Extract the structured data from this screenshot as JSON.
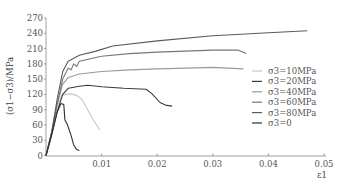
{
  "chart_data": {
    "type": "line",
    "title": "",
    "xlabel": "ε1",
    "ylabel": "(σ1−σ3)/MPa",
    "xlim": [
      0,
      0.05
    ],
    "ylim": [
      0,
      270
    ],
    "x_ticks": [
      "0.01",
      "0.02",
      "0.03",
      "0.04",
      "0.05"
    ],
    "y_ticks": [
      "0",
      "30",
      "60",
      "90",
      "120",
      "150",
      "180",
      "210",
      "240",
      "270"
    ],
    "grid": false,
    "legend_position": "right-middle",
    "series": [
      {
        "name": "σ3=10MPa",
        "color": "#c8c8c8",
        "points": [
          [
            0,
            0
          ],
          [
            0.001,
            45
          ],
          [
            0.002,
            95
          ],
          [
            0.0028,
            118
          ],
          [
            0.0035,
            120
          ],
          [
            0.0045,
            121
          ],
          [
            0.0055,
            118
          ],
          [
            0.0065,
            110
          ],
          [
            0.0075,
            90
          ],
          [
            0.0085,
            70
          ],
          [
            0.0097,
            50
          ]
        ]
      },
      {
        "name": "σ3=20MPa",
        "color": "#3a3a3a",
        "points": [
          [
            0,
            0
          ],
          [
            0.001,
            40
          ],
          [
            0.002,
            85
          ],
          [
            0.003,
            120
          ],
          [
            0.004,
            132
          ],
          [
            0.006,
            136
          ],
          [
            0.0075,
            138
          ],
          [
            0.01,
            135
          ],
          [
            0.014,
            132
          ],
          [
            0.018,
            130
          ],
          [
            0.019,
            122
          ],
          [
            0.0205,
            104
          ],
          [
            0.0215,
            99
          ],
          [
            0.0227,
            97
          ]
        ]
      },
      {
        "name": "σ3=40MPa",
        "color": "#9a9a9a",
        "points": [
          [
            0,
            0
          ],
          [
            0.001,
            45
          ],
          [
            0.002,
            100
          ],
          [
            0.003,
            140
          ],
          [
            0.004,
            153
          ],
          [
            0.006,
            160
          ],
          [
            0.01,
            165
          ],
          [
            0.015,
            168
          ],
          [
            0.02,
            170
          ],
          [
            0.027,
            172
          ],
          [
            0.03,
            173
          ],
          [
            0.0355,
            170
          ]
        ]
      },
      {
        "name": "σ3=60MPa",
        "color": "#777777",
        "points": [
          [
            0,
            0
          ],
          [
            0.001,
            45
          ],
          [
            0.002,
            100
          ],
          [
            0.003,
            150
          ],
          [
            0.004,
            172
          ],
          [
            0.0045,
            168
          ],
          [
            0.005,
            180
          ],
          [
            0.0055,
            175
          ],
          [
            0.006,
            185
          ],
          [
            0.008,
            190
          ],
          [
            0.01,
            195
          ],
          [
            0.015,
            200
          ],
          [
            0.02,
            203
          ],
          [
            0.025,
            205
          ],
          [
            0.03,
            207
          ],
          [
            0.0345,
            207
          ],
          [
            0.036,
            200
          ]
        ]
      },
      {
        "name": "σ3=80MPa",
        "color": "#5a5a5a",
        "points": [
          [
            0,
            0
          ],
          [
            0.001,
            45
          ],
          [
            0.002,
            110
          ],
          [
            0.003,
            165
          ],
          [
            0.004,
            185
          ],
          [
            0.006,
            197
          ],
          [
            0.009,
            205
          ],
          [
            0.012,
            215
          ],
          [
            0.02,
            225
          ],
          [
            0.03,
            235
          ],
          [
            0.04,
            241
          ],
          [
            0.047,
            245
          ]
        ]
      },
      {
        "name": "σ3=0",
        "color": "#2e2e2e",
        "points": [
          [
            0,
            0
          ],
          [
            0.001,
            40
          ],
          [
            0.002,
            85
          ],
          [
            0.0027,
            102
          ],
          [
            0.0032,
            100
          ],
          [
            0.0034,
            70
          ],
          [
            0.0038,
            62
          ],
          [
            0.0045,
            40
          ],
          [
            0.005,
            20
          ],
          [
            0.0055,
            12
          ],
          [
            0.006,
            10
          ]
        ]
      }
    ]
  },
  "legend": {
    "items": [
      {
        "label": "σ3=10MPa",
        "color": "#c8c8c8"
      },
      {
        "label": "σ3=20MPa",
        "color": "#3a3a3a"
      },
      {
        "label": "σ3=40MPa",
        "color": "#9a9a9a"
      },
      {
        "label": "σ3=60MPa",
        "color": "#777777"
      },
      {
        "label": "σ3=80MPa",
        "color": "#5a5a5a"
      },
      {
        "label": "σ3=0",
        "color": "#2e2e2e"
      }
    ]
  }
}
